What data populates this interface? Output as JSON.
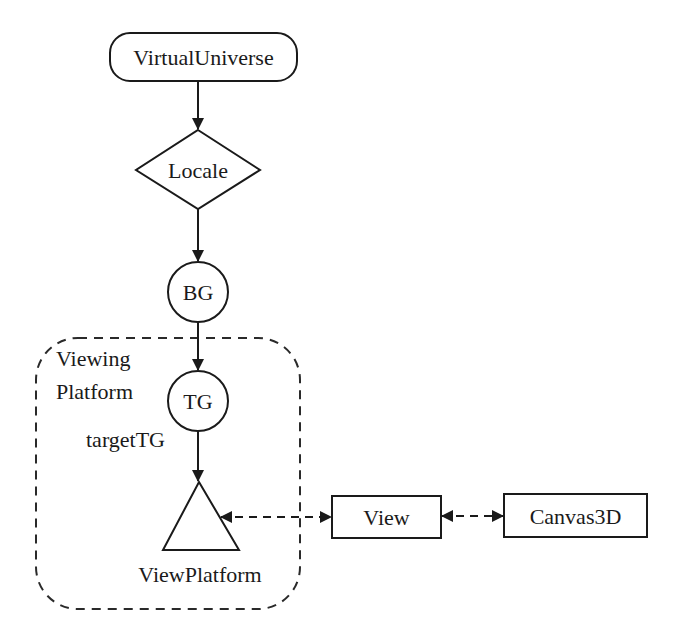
{
  "diagram": {
    "nodes": {
      "virtual_universe": {
        "label": "VirtualUniverse",
        "shape": "rounded-rectangle"
      },
      "locale": {
        "label": "Locale",
        "shape": "diamond"
      },
      "bg": {
        "label": "BG",
        "shape": "circle"
      },
      "tg": {
        "label": "TG",
        "shape": "circle"
      },
      "view_platform": {
        "label": "ViewPlatform",
        "shape": "triangle"
      },
      "view": {
        "label": "View",
        "shape": "rectangle"
      },
      "canvas3d": {
        "label": "Canvas3D",
        "shape": "rectangle"
      }
    },
    "region": {
      "label_line1": "Viewing",
      "label_line2": "Platform",
      "style": "dashed-rounded"
    },
    "annotations": {
      "target_tg": "targetTG"
    },
    "edges": [
      {
        "from": "VirtualUniverse",
        "to": "Locale",
        "style": "solid",
        "arrow": "forward"
      },
      {
        "from": "Locale",
        "to": "BG",
        "style": "solid",
        "arrow": "forward"
      },
      {
        "from": "BG",
        "to": "TG",
        "style": "solid",
        "arrow": "forward"
      },
      {
        "from": "TG",
        "to": "ViewPlatform",
        "style": "solid",
        "arrow": "forward"
      },
      {
        "from": "ViewPlatform",
        "to": "View",
        "style": "dashed",
        "arrow": "both"
      },
      {
        "from": "View",
        "to": "Canvas3D",
        "style": "dashed",
        "arrow": "both"
      }
    ],
    "colors": {
      "stroke": "#1a1a1a",
      "background": "#ffffff"
    }
  }
}
